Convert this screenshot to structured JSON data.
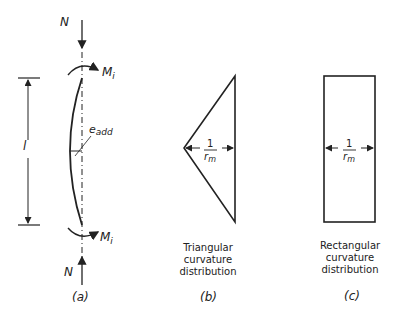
{
  "diagram": {
    "panel_a": {
      "axial_force_top": "N",
      "axial_force_bottom": "N",
      "moment_top": "M",
      "moment_top_sub": "i",
      "moment_bottom": "M",
      "moment_bottom_sub": "i",
      "length": "l",
      "eccentricity": "e",
      "eccentricity_sub": "add",
      "caption": "(a)"
    },
    "panel_b": {
      "fraction_num": "1",
      "fraction_den": "r",
      "fraction_den_sub": "m",
      "label_line1": "Triangular",
      "label_line2": "curvature",
      "label_line3": "distribution",
      "caption": "(b)"
    },
    "panel_c": {
      "fraction_num": "1",
      "fraction_den": "r",
      "fraction_den_sub": "m",
      "label_line1": "Rectangular",
      "label_line2": "curvature",
      "label_line3": "distribution",
      "caption": "(c)"
    }
  }
}
